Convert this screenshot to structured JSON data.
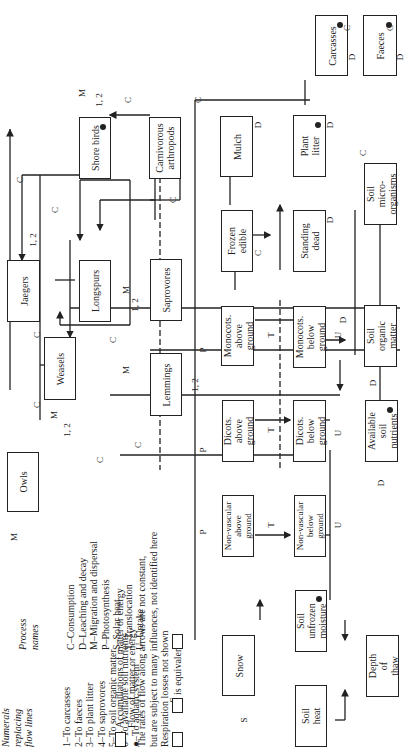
{
  "legend": {
    "numerals_title": "Numerals\nreplacing\nflow lines",
    "numerals": [
      "1–To carcasses",
      "2–To faeces",
      "3–To plant litter",
      "4–To saprovores",
      "5–To soil organic matter",
      "6–To available soil nutrients",
      "●–To aquatic system"
    ],
    "process_title": "Process\nnames",
    "processes": [
      "C–Consumption",
      "D–Leaching and decay",
      "M–Migration and dispersal",
      "P–Photosynthesis",
      "S–Solar heat",
      "T–Translocation",
      "U–Uptake"
    ],
    "accumulation": "Accumulations of matter or energy",
    "flow": "Flow of matter or energy",
    "rates_note": "The rates of flow along arrows are not constant,\nbut are subject to many influences, not identified here",
    "respiration": "Respiration losses not shown",
    "equivalence": "is equivalent to",
    "equiv_label": "1"
  },
  "compartments": {
    "owls": "Owls",
    "weasels": "Weasels",
    "jaegers": "Jaegers",
    "lemmings": "Lemmings",
    "longspurs": "Longspurs",
    "shore_birds": "Shore birds",
    "carnivorous_arthropods": "Carnivorous\narthropods",
    "saprovores": "Saprovores",
    "mulch": "Mulch",
    "plant_litter": "Plant\nlitter",
    "frozen_edible": "Frozen\nedible",
    "standing_dead": "Standing\ndead",
    "monocots_above": "Monocots.\nabove\nground",
    "monocots_below": "Monocots.\nbelow\nground",
    "dicots_above": "Dicots.\nabove\nground",
    "dicots_below": "Dicots.\nbelow\nground",
    "nonvascular_above": "Non-vascular\nabove\nground",
    "nonvascular_below": "Non-vascular\nbelow\nground",
    "soil_organic_matter": "Soil\norganic\nmatter",
    "soil_microorganisms": "Soil\nmicro-\norganisms",
    "available_soil_nutrients": "Available\nsoil\nnutrients",
    "soil_unfrozen_moisture": "Soil\nunfrozen\nmoisture",
    "snow": "Snow",
    "soil_heat": "Soil\nheat",
    "depth_of_thaw": "Depth\nof\nthaw",
    "carcasses": "Carcasses",
    "faeces": "Faeces"
  },
  "flow_labels": {
    "C": "C",
    "D": "D",
    "M": "M",
    "P": "P",
    "S": "S",
    "T": "T",
    "U": "U",
    "n12": "1, 2",
    "n3": "3",
    "n4": "4",
    "n5": "5",
    "n6": "6",
    "n2": "2"
  }
}
